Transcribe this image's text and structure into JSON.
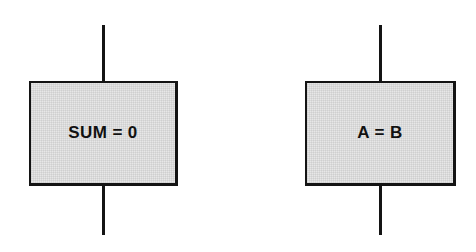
{
  "diagram": {
    "type": "flowchart",
    "background_color": "#ffffff",
    "node_fill_color": "#e7e7e7",
    "stroke_color": "#141414",
    "nodes": [
      {
        "id": "sum-node",
        "shape": "rectangle",
        "role": "process",
        "label": "SUM = 0"
      },
      {
        "id": "ab-node",
        "shape": "rectangle",
        "role": "process",
        "label": "A = B"
      }
    ],
    "connectors": [
      {
        "id": "sum-inflow",
        "orientation": "vertical",
        "attaches_to": "sum-node",
        "side": "top"
      },
      {
        "id": "sum-outflow",
        "orientation": "vertical",
        "attaches_to": "sum-node",
        "side": "bottom"
      },
      {
        "id": "ab-inflow",
        "orientation": "vertical",
        "attaches_to": "ab-node",
        "side": "top"
      },
      {
        "id": "ab-outflow",
        "orientation": "vertical",
        "attaches_to": "ab-node",
        "side": "bottom"
      }
    ]
  }
}
